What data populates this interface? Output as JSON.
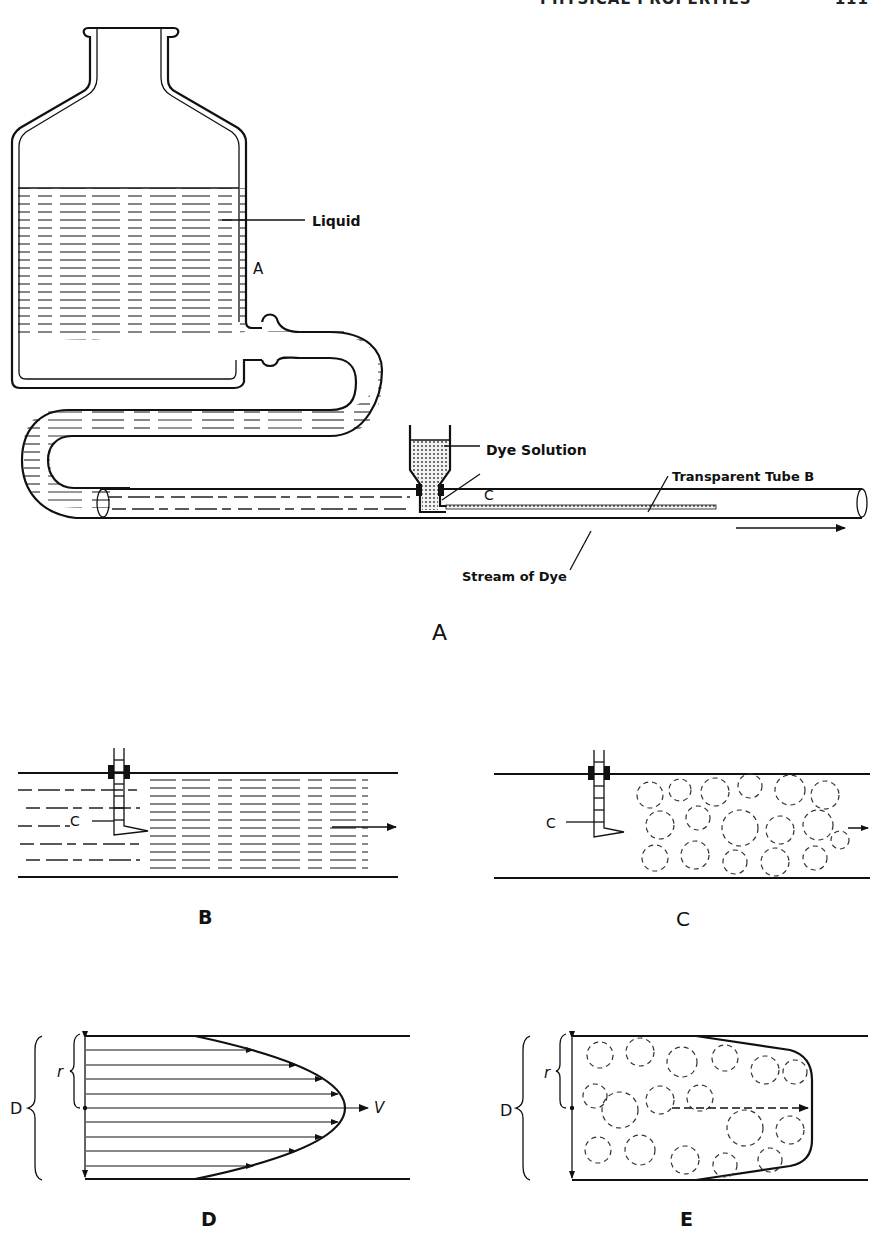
{
  "header": {
    "running_title": "PHYSICAL PROPERTIES",
    "page_number": "111"
  },
  "figure_a": {
    "caption": "A",
    "labels": {
      "liquid": "Liquid",
      "bottle_point": "A",
      "dye_solution": "Dye Solution",
      "injector": "C",
      "tube": "Transparent Tube B",
      "stream": "Stream of Dye"
    }
  },
  "figure_b": {
    "caption": "B",
    "labels": {
      "injector": "C"
    }
  },
  "figure_c": {
    "caption": "C",
    "labels": {
      "injector": "C"
    }
  },
  "figure_d": {
    "caption": "D",
    "labels": {
      "diameter": "D",
      "radius": "r",
      "velocity": "V"
    }
  },
  "figure_e": {
    "caption": "E",
    "labels": {
      "diameter": "D",
      "radius": "r"
    }
  },
  "colors": {
    "ink": "#111111",
    "paper": "#ffffff"
  }
}
